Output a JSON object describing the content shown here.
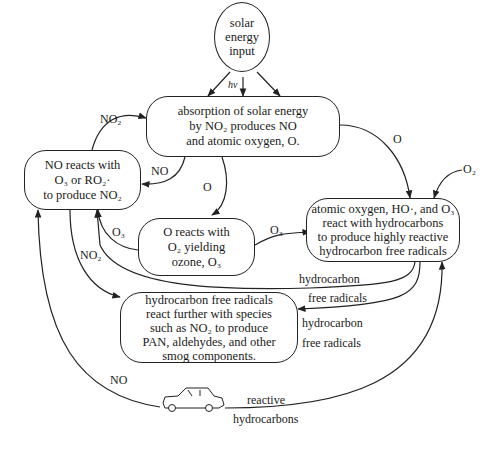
{
  "nodes": {
    "solar": {
      "lines": [
        "solar",
        "energy",
        "input"
      ]
    },
    "absorption": {
      "lines": [
        "absorption of solar energy",
        "by NO₂ produces NO",
        "and atomic oxygen, O."
      ]
    },
    "no_reacts": {
      "lines": [
        "NO reacts with",
        "O₃ or RO₂·",
        "to produce NO₂"
      ]
    },
    "o_reacts": {
      "lines": [
        "O reacts with",
        "O₂ yielding",
        "ozone, O₃"
      ]
    },
    "atomic": {
      "lines": [
        "atomic oxygen, HO·, and O₃",
        "react with hydrocarbons",
        "to produce highly reactive",
        "hydrocarbon free radicals"
      ]
    },
    "hc_radicals": {
      "lines": [
        "hydrocarbon free radicals",
        "react further with species",
        "such as NO₂ to produce",
        "PAN, aldehydes, and other",
        "smog components."
      ]
    }
  },
  "edge_labels": {
    "hv": "hν",
    "no2_top": "NO₂",
    "no_mid": "NO",
    "o_down": "O",
    "o_right": "O",
    "o2_in": "O₂",
    "o3_left": "O₃",
    "o3_right": "O₃",
    "no2_down": "NO₂",
    "hc1_a": "hydrocarbon",
    "hc1_b": "free radicals",
    "hc2_a": "hydrocarbon",
    "hc2_b": "free radicals",
    "no_car": "NO",
    "reactive_a": "reactive",
    "reactive_b": "hydrocarbons"
  },
  "icons": {
    "car": "car-icon"
  }
}
